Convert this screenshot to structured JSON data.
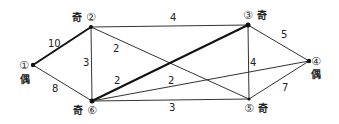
{
  "graph": {
    "nodes": [
      {
        "id": "1",
        "symbol": "①",
        "parity": "偶",
        "x": 33,
        "y": 65
      },
      {
        "id": "2",
        "symbol": "②",
        "parity": "奇",
        "x": 91,
        "y": 27
      },
      {
        "id": "3",
        "symbol": "③",
        "parity": "奇",
        "x": 248,
        "y": 25
      },
      {
        "id": "4",
        "symbol": "④",
        "parity": "偶",
        "x": 309,
        "y": 61
      },
      {
        "id": "5",
        "symbol": "⑤",
        "parity": "奇",
        "x": 249,
        "y": 99
      },
      {
        "id": "6",
        "symbol": "⑥",
        "parity": "奇",
        "x": 92,
        "y": 101
      }
    ],
    "edges": [
      {
        "from": "1",
        "to": "2",
        "weight": "10",
        "thick": true
      },
      {
        "from": "1",
        "to": "6",
        "weight": "8",
        "thick": false
      },
      {
        "from": "2",
        "to": "3",
        "weight": "4",
        "thick": false
      },
      {
        "from": "2",
        "to": "6",
        "weight": "3",
        "thick": false
      },
      {
        "from": "2",
        "to": "5",
        "weight": "2",
        "thick": false
      },
      {
        "from": "6",
        "to": "3",
        "weight": "2",
        "thick": true
      },
      {
        "from": "6",
        "to": "4",
        "weight": "2",
        "thick": false
      },
      {
        "from": "6",
        "to": "5",
        "weight": "3",
        "thick": false
      },
      {
        "from": "3",
        "to": "4",
        "weight": "5",
        "thick": false
      },
      {
        "from": "3",
        "to": "5",
        "weight": "4",
        "thick": false
      },
      {
        "from": "5",
        "to": "4",
        "weight": "7",
        "thick": false
      }
    ]
  }
}
